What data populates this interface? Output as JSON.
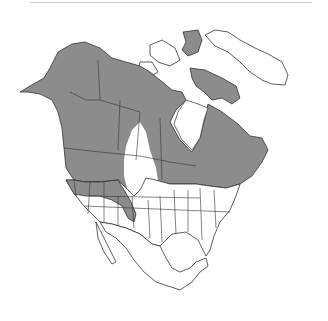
{
  "map": {
    "type": "species-range-map",
    "region": "North America",
    "legend": [],
    "colors": {
      "range": "#8c8c8c",
      "land": "#ffffff",
      "border": "#333333",
      "header_rule": "#c8c8c8"
    },
    "range_description": "Shaded range covers Alaska, most of Canada, Pacific Northwest, northern Rockies, Great Lakes and northeastern United States; unshaded gap across the northern Great Plains"
  }
}
